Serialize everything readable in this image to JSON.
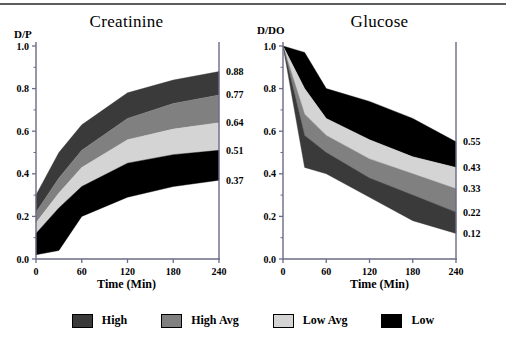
{
  "figure": {
    "background_color": "#ffffff",
    "top_rule_color": "#5d5d5d",
    "axis_color": "#6b6b87"
  },
  "legend": {
    "items": [
      {
        "label": "High",
        "color": "#3a3a3a"
      },
      {
        "label": "High Avg",
        "color": "#808080"
      },
      {
        "label": "Low Avg",
        "color": "#d4d4d4"
      },
      {
        "label": "Low",
        "color": "#000000"
      }
    ]
  },
  "chart_data": [
    {
      "type": "area",
      "panel": "left",
      "title": "Creatinine",
      "ylabel": "D/P",
      "xlabel": "Time (Min)",
      "x": [
        0,
        30,
        60,
        120,
        180,
        240
      ],
      "xlim": [
        0,
        240
      ],
      "ylim": [
        0.0,
        1.0
      ],
      "xticks": [
        0,
        60,
        120,
        180,
        240
      ],
      "yticks": [
        "0.0",
        "0.2",
        "0.4",
        "0.6",
        "0.8",
        "1.0"
      ],
      "yticks_values": [
        0.0,
        0.2,
        0.4,
        0.6,
        0.8,
        1.0
      ],
      "grid": false,
      "legend_position": "bottom",
      "right_axis_labels": [
        "0.88",
        "0.77",
        "0.64",
        "0.51",
        "0.37"
      ],
      "right_axis_values": [
        0.88,
        0.77,
        0.64,
        0.51,
        0.37
      ],
      "band_order_top_to_bottom": [
        "High",
        "High Avg",
        "Low Avg",
        "Low"
      ],
      "series": [
        {
          "name": "High",
          "color": "#3a3a3a",
          "values": [
            0.3,
            0.5,
            0.63,
            0.78,
            0.84,
            0.88
          ]
        },
        {
          "name": "High Avg",
          "color": "#808080",
          "values": [
            0.22,
            0.38,
            0.51,
            0.66,
            0.73,
            0.77
          ]
        },
        {
          "name": "Low Avg",
          "color": "#d4d4d4",
          "values": [
            0.17,
            0.31,
            0.43,
            0.56,
            0.61,
            0.64
          ]
        },
        {
          "name": "Low",
          "color": "#000000",
          "values": [
            0.12,
            0.24,
            0.34,
            0.45,
            0.49,
            0.51
          ]
        },
        {
          "name": "Baseline",
          "color": "#ffffff",
          "values": [
            0.02,
            0.04,
            0.2,
            0.29,
            0.34,
            0.37
          ]
        }
      ]
    },
    {
      "type": "area",
      "panel": "right",
      "title": "Glucose",
      "ylabel": "D/DO",
      "xlabel": "Time (Min)",
      "x": [
        0,
        30,
        60,
        120,
        180,
        240
      ],
      "xlim": [
        0,
        240
      ],
      "ylim": [
        0.0,
        1.0
      ],
      "xticks": [
        0,
        60,
        120,
        180,
        240
      ],
      "yticks": [
        "0.0",
        "0.2",
        "0.4",
        "0.6",
        "0.8",
        "1.0"
      ],
      "yticks_values": [
        0.0,
        0.2,
        0.4,
        0.6,
        0.8,
        1.0
      ],
      "grid": false,
      "legend_position": "bottom",
      "right_axis_labels": [
        "0.55",
        "0.43",
        "0.33",
        "0.22",
        "0.12"
      ],
      "right_axis_values": [
        0.55,
        0.43,
        0.33,
        0.22,
        0.12
      ],
      "band_order_top_to_bottom": [
        "Low",
        "Low Avg",
        "High Avg",
        "High"
      ],
      "series": [
        {
          "name": "Low",
          "color": "#000000",
          "values": [
            1.0,
            0.97,
            0.8,
            0.74,
            0.66,
            0.55
          ]
        },
        {
          "name": "Low Avg",
          "color": "#d4d4d4",
          "values": [
            1.0,
            0.8,
            0.66,
            0.56,
            0.48,
            0.43
          ]
        },
        {
          "name": "High Avg",
          "color": "#808080",
          "values": [
            1.0,
            0.68,
            0.58,
            0.47,
            0.4,
            0.33
          ]
        },
        {
          "name": "High",
          "color": "#3a3a3a",
          "values": [
            1.0,
            0.58,
            0.5,
            0.38,
            0.3,
            0.22
          ]
        },
        {
          "name": "Baseline",
          "color": "#ffffff",
          "values": [
            1.0,
            0.43,
            0.4,
            0.29,
            0.18,
            0.12
          ]
        }
      ]
    }
  ]
}
